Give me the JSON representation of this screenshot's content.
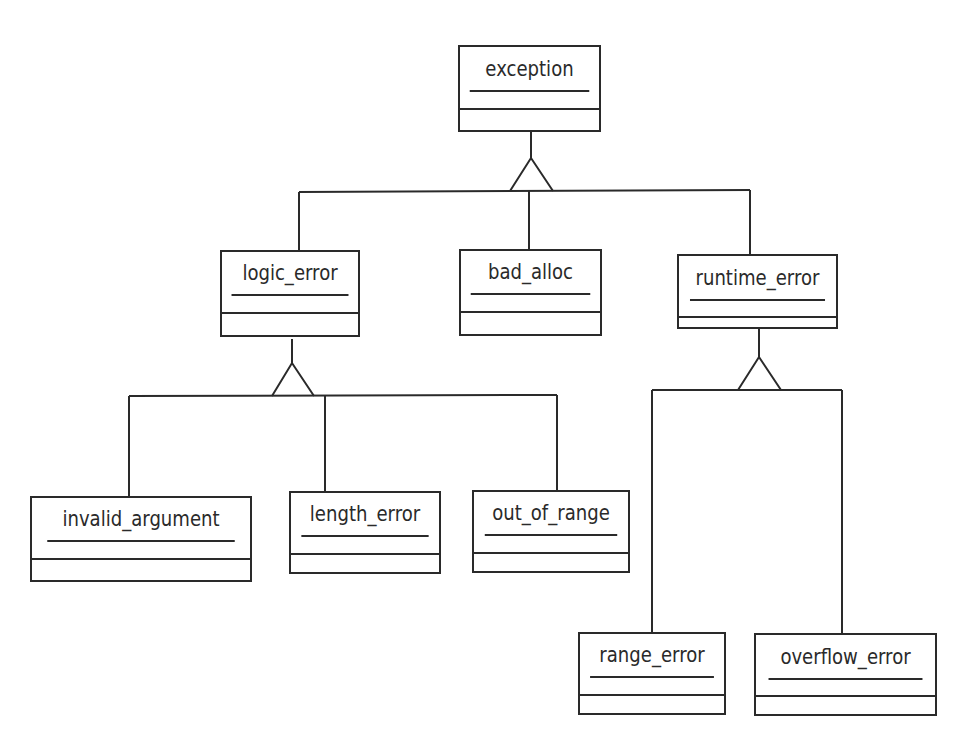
{
  "diagram": {
    "type": "UML class hierarchy",
    "line_color": "#2a2a2a",
    "classes": [
      {
        "id": "exception",
        "name": "exception",
        "box": [
          458,
          45,
          143,
          87
        ],
        "name_h": 43,
        "attr_h": 16
      },
      {
        "id": "logic_error",
        "name": "logic_error",
        "box": [
          220,
          250,
          140,
          87
        ],
        "name_h": 42,
        "attr_h": 16
      },
      {
        "id": "bad_alloc",
        "name": "bad_alloc",
        "box": [
          459,
          249,
          143,
          87
        ],
        "name_h": 42,
        "attr_h": 16
      },
      {
        "id": "runtime_error",
        "name": "runtime_error",
        "box": [
          677,
          254,
          161,
          75
        ],
        "name_h": 43,
        "attr_h": 15
      },
      {
        "id": "invalid_argument",
        "name": "invalid_argument",
        "box": [
          30,
          496,
          222,
          86
        ],
        "name_h": 42,
        "attr_h": 16
      },
      {
        "id": "length_error",
        "name": "length_error",
        "box": [
          289,
          491,
          152,
          83
        ],
        "name_h": 42,
        "attr_h": 16
      },
      {
        "id": "out_of_range",
        "name": "out_of_range",
        "box": [
          472,
          490,
          158,
          83
        ],
        "name_h": 42,
        "attr_h": 16
      },
      {
        "id": "range_error",
        "name": "range_error",
        "box": [
          578,
          632,
          148,
          83
        ],
        "name_h": 42,
        "attr_h": 16
      },
      {
        "id": "overflow_error",
        "name": "overflow_error",
        "box": [
          754,
          633,
          183,
          83
        ],
        "name_h": 43,
        "attr_h": 15
      }
    ],
    "generalizations": [
      {
        "parent": "exception",
        "children": [
          "logic_error",
          "bad_alloc",
          "runtime_error"
        ]
      },
      {
        "parent": "logic_error",
        "children": [
          "invalid_argument",
          "length_error",
          "out_of_range"
        ]
      },
      {
        "parent": "runtime_error",
        "children": [
          "range_error",
          "overflow_error"
        ]
      }
    ]
  }
}
